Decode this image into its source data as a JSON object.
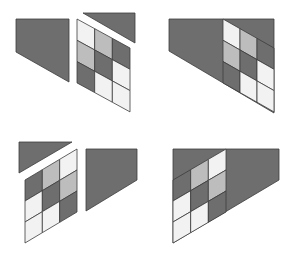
{
  "colors": {
    "background": "#ffffff",
    "dark": "#6e6e6e",
    "mid": "#bdbdbd",
    "light": "#f2f2f2",
    "stroke": "#3c3c3c"
  },
  "figures": [
    {
      "id": "top-left",
      "description": "Separated pieces: trapezoid, grid, triangle",
      "trapezoid": [
        [
          16,
          19
        ],
        [
          69,
          19
        ],
        [
          69,
          82
        ],
        [
          16,
          52
        ]
      ],
      "triangle": [
        [
          83,
          13
        ],
        [
          135,
          13
        ],
        [
          135,
          43
        ]
      ],
      "grid": {
        "x0": 77,
        "x1": 130,
        "yTopLeft": 19,
        "yTopRight": 48,
        "cellH": 21.3,
        "cells": [
          [
            "light",
            "mid",
            "dark"
          ],
          [
            "mid",
            "dark",
            "light"
          ],
          [
            "dark",
            "light",
            "light"
          ]
        ]
      }
    },
    {
      "id": "top-right",
      "description": "Assembled shape with grid on right",
      "outline": [
        [
          169,
          19
        ],
        [
          274,
          19
        ],
        [
          274,
          113
        ],
        [
          169,
          51
        ]
      ],
      "grid": {
        "x0": 223,
        "x1": 274,
        "yTopLeft": 19,
        "yTopRight": 48,
        "cellH": 21.3,
        "cells": [
          [
            "light",
            "mid",
            "dark"
          ],
          [
            "mid",
            "dark",
            "light"
          ],
          [
            "dark",
            "light",
            "light"
          ]
        ]
      }
    },
    {
      "id": "bottom-left",
      "description": "Separated pieces: triangle, grid, trapezoid",
      "trapezoid": [
        [
          86,
          149
        ],
        [
          137,
          149
        ],
        [
          137,
          180
        ],
        [
          86,
          211
        ]
      ],
      "triangle": [
        [
          19,
          142
        ],
        [
          72,
          142
        ],
        [
          19,
          173
        ]
      ],
      "grid": {
        "x0": 25,
        "x1": 77,
        "yTopLeft": 180,
        "yTopRight": 149,
        "cellH": 21.0,
        "cells": [
          [
            "dark",
            "mid",
            "light"
          ],
          [
            "light",
            "dark",
            "mid"
          ],
          [
            "light",
            "light",
            "dark"
          ]
        ]
      }
    },
    {
      "id": "bottom-right",
      "description": "Assembled shape with grid on left",
      "outline": [
        [
          173,
          149
        ],
        [
          279,
          149
        ],
        [
          279,
          180
        ],
        [
          173,
          243
        ]
      ],
      "grid": {
        "x0": 173,
        "x1": 226,
        "yTopLeft": 180,
        "yTopRight": 149,
        "cellH": 21.0,
        "cells": [
          [
            "dark",
            "mid",
            "light"
          ],
          [
            "light",
            "dark",
            "mid"
          ],
          [
            "light",
            "light",
            "dark"
          ]
        ]
      }
    }
  ]
}
